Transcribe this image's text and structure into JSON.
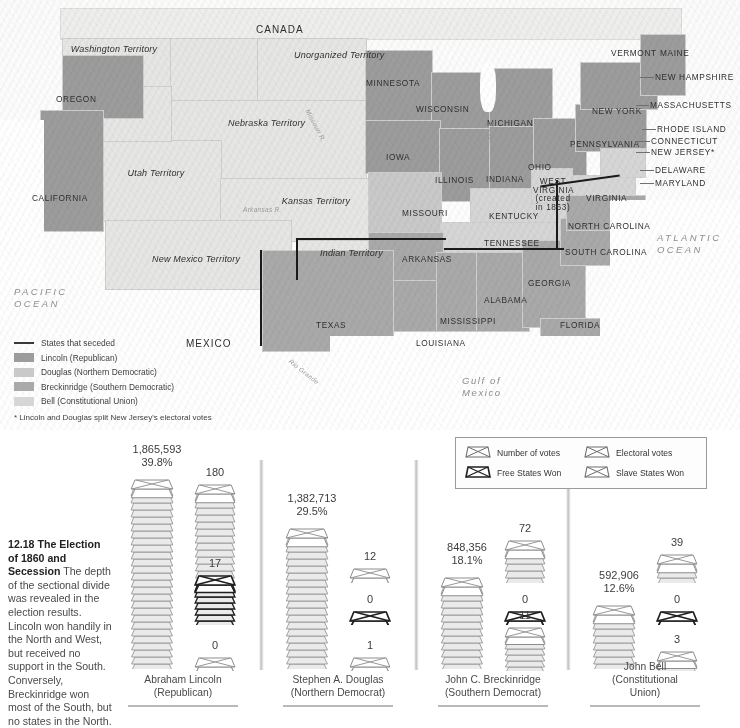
{
  "figure": {
    "number": "12.18",
    "title_line1": "The",
    "title_line2": "Election of 1860",
    "title_line3": "and Secession",
    "body": "The depth of the sectional divide was revealed in the election results. Lincoln won handily in the North and West, but received no support in the South. Conversely, Breckinridge won most of the South, but no states in the North."
  },
  "map": {
    "legend": {
      "seceded": "States that seceded",
      "lincoln": "Lincoln  (Republican)",
      "douglas": "Douglas (Northern Democratic)",
      "breckinridge": "Breckinridge (Southern Democratic)",
      "bell": "Bell (Constitutional Union)",
      "footnote": "* Lincoln and Douglas split New Jersey's electoral votes"
    },
    "colors": {
      "seceded_line": "#1a1a1a",
      "lincoln": "#9c9c9c",
      "douglas": "#c9c9c9",
      "breckinridge": "#a9a9a9",
      "bell": "#d6d6d6",
      "land": "#e6e6e4",
      "water": "#ffffff"
    },
    "countries": [
      "CANADA",
      "MEXICO"
    ],
    "oceans": [
      {
        "line1": "PACIFIC",
        "line2": "OCEAN"
      },
      {
        "line1": "ATLANTIC",
        "line2": "OCEAN"
      },
      {
        "line1": "Gulf of",
        "line2": "Mexico"
      }
    ],
    "rivers": [
      "Missouri R.",
      "Arkansas R.",
      "Rio Grande",
      "Lake Michigan"
    ],
    "territories": [
      "Washington Territory",
      "Unorganized Territory",
      "Nebraska Territory",
      "Utah Territory",
      "Kansas Territory",
      "New Mexico Territory",
      "Indian Territory"
    ],
    "states": [
      "OREGON",
      "CALIFORNIA",
      "MINNESOTA",
      "WISCONSIN",
      "MICHIGAN",
      "IOWA",
      "ILLINOIS",
      "INDIANA",
      "OHIO",
      "MISSOURI",
      "KENTUCKY",
      "TENNESSEE",
      "ARKANSAS",
      "TEXAS",
      "LOUISIANA",
      "MISSISSIPPI",
      "ALABAMA",
      "GEORGIA",
      "FLORIDA",
      "SOUTH CAROLINA",
      "NORTH CAROLINA",
      "VIRGINIA",
      "PENNSYLVANIA",
      "NEW YORK",
      "VERMONT",
      "MAINE",
      "NEW HAMPSHIRE",
      "MASSACHUSETTS",
      "RHODE ISLAND",
      "CONNECTICUT",
      "NEW JERSEY*",
      "DELAWARE",
      "MARYLAND"
    ],
    "west_virginia": {
      "name_line1": "WEST",
      "name_line2": "VIRGINIA",
      "sub_line1": "(created",
      "sub_line2": "in 1863)"
    }
  },
  "chart_data": {
    "type": "bar",
    "legend": {
      "number_of_votes": "Number of votes",
      "electoral_votes": "Electoral votes",
      "free_states_won": "Free States Won",
      "slave_states_won": "Slave States Won"
    },
    "categories": [
      "Abraham Lincoln",
      "Stephen A. Douglas",
      "John C. Breckinridge",
      "John Bell"
    ],
    "candidates": [
      {
        "name_line1": "Abraham Lincoln",
        "name_line2": "(Republican)",
        "popular_votes": "1,865,593",
        "popular_pct": "39.8%",
        "popular_value": 1865593,
        "pct_value": 39.8,
        "electoral": "180",
        "electoral_value": 180,
        "free_states": "17",
        "free_states_value": 17,
        "slave_states": "0",
        "slave_states_value": 0
      },
      {
        "name_line1": "Stephen A. Douglas",
        "name_line2": "(Northern Democrat)",
        "popular_votes": "1,382,713",
        "popular_pct": "29.5%",
        "popular_value": 1382713,
        "pct_value": 29.5,
        "electoral": "12",
        "electoral_value": 12,
        "free_states": "0",
        "free_states_value": 0,
        "slave_states": "1",
        "slave_states_value": 1
      },
      {
        "name_line1": "John C. Breckinridge",
        "name_line2": "(Southern Democrat)",
        "popular_votes": "848,356",
        "popular_pct": "18.1%",
        "popular_value": 848356,
        "pct_value": 18.1,
        "electoral": "72",
        "electoral_value": 72,
        "free_states": "0",
        "free_states_value": 0,
        "slave_states": "11",
        "slave_states_value": 11
      },
      {
        "name_line1": "John Bell",
        "name_line2": "(Constitutional",
        "name_line3": "Union)",
        "popular_votes": "592,906",
        "popular_pct": "12.6%",
        "popular_value": 592906,
        "pct_value": 12.6,
        "electoral": "39",
        "electoral_value": 39,
        "free_states": "0",
        "free_states_value": 0,
        "slave_states": "3",
        "slave_states_value": 3
      }
    ],
    "ylabel": "",
    "xlabel": "",
    "grid": false,
    "legend_position": "top-right"
  }
}
